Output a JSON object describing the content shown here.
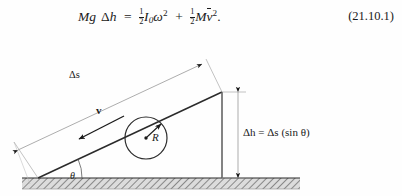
{
  "equation": {
    "number": "(21.10.1)",
    "lhs_mass": "M",
    "lhs_g": "g",
    "lhs_delta": "Δ",
    "lhs_h": "h",
    "equals": "=",
    "half_num": "1",
    "half_den": "2",
    "inertia_symbol": "I",
    "inertia_sub": "0",
    "omega": "ω",
    "omega_power": "2",
    "plus": "+",
    "mass2": "M",
    "velocity_symbol": "v",
    "velocity_power": "2",
    "period": ".",
    "plain_text": "Mg Δh = ½I₀ω² + ½Mv̄²."
  },
  "diagram": {
    "labels": {
      "delta_s": "Δs",
      "velocity": "v",
      "radius": "R",
      "delta_h": "Δh = Δs (sin θ)",
      "theta": "θ"
    },
    "colors": {
      "ink": "#1a1a1a",
      "line": "#2b2b2b",
      "thin_line": "#8a8a8a",
      "ground_fill": "#d8d8d8",
      "background": "#fefefe"
    },
    "geometry": {
      "incline_base_x": 38,
      "incline_base_y": 144,
      "incline_apex_x": 222,
      "incline_apex_y": 58,
      "ground_top_y": 144,
      "ground_bottom_y": 155,
      "disk_center_x": 146,
      "disk_center_y": 104,
      "disk_radius": 21,
      "angle_theta_degrees": 25
    }
  }
}
